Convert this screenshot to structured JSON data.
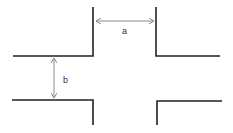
{
  "diagram": {
    "type": "intersection-dimension-drawing",
    "labels": {
      "a": "a",
      "b": "b"
    },
    "colors": {
      "walls": "#222222",
      "dimension_arrows": "#8a8a8a",
      "text": "#333333",
      "background": "#ffffff"
    }
  }
}
